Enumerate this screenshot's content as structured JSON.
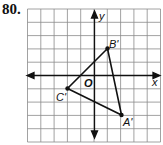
{
  "problem_number": "80.",
  "graph": {
    "x_axis_label": "x",
    "y_axis_label": "y",
    "origin_label": "O",
    "grid": {
      "x_min": -5,
      "x_max": 5,
      "y_min": -5,
      "y_max": 5
    },
    "points": [
      {
        "label": "A'",
        "x": 2,
        "y": -3
      },
      {
        "label": "B'",
        "x": 1,
        "y": 2
      },
      {
        "label": "C'",
        "x": -2,
        "y": -1
      }
    ],
    "colors": {
      "line": "#111111",
      "grid": "#8a8a8a"
    }
  }
}
